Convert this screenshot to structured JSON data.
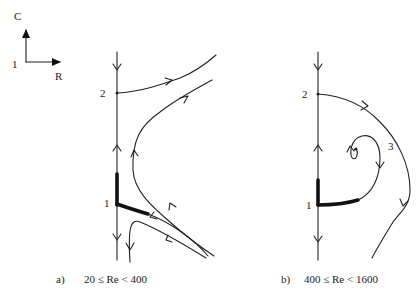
{
  "axes_legend": {
    "vertical_label": "C",
    "horizontal_label": "R",
    "origin_label": "1"
  },
  "panels": [
    {
      "id": "a",
      "caption_prefix": "a)",
      "caption_condition": "20 ≤ Re < 400",
      "points": [
        {
          "label": "2",
          "kind": "node on axis"
        },
        {
          "label": "1",
          "kind": "node on axis"
        }
      ]
    },
    {
      "id": "b",
      "caption_prefix": "b)",
      "caption_condition": "400 ≤ Re < 1600",
      "points": [
        {
          "label": "2",
          "kind": "node on axis"
        },
        {
          "label": "1",
          "kind": "node on axis"
        },
        {
          "label": "3",
          "kind": "focus (spiral)"
        }
      ]
    }
  ]
}
